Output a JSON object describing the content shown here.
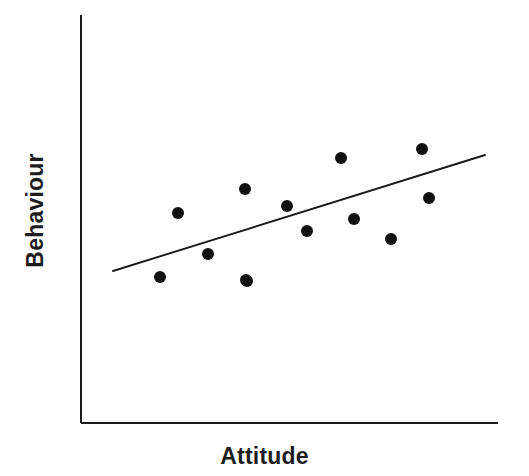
{
  "chart_data": {
    "type": "scatter",
    "title": "",
    "subtitle": "",
    "xlabel": "Attitude",
    "ylabel": "Behaviour",
    "grid": false,
    "legend": null,
    "axis_color": "#1a1a1a",
    "point_color": "#111111",
    "line_color": "#1a1a1a",
    "point_radius": 6,
    "xlim": [
      0,
      100
    ],
    "ylim": [
      0,
      100
    ],
    "axes": {
      "x_axis_pixel_y": 423,
      "y_axis_pixel_x": 81,
      "y_axis_top_pixel": 15,
      "x_axis_right_pixel": 498
    },
    "points": [
      {
        "px": 160,
        "py": 277,
        "x": 19.0,
        "y": 35.8
      },
      {
        "px": 178,
        "py": 213,
        "x": 23.3,
        "y": 51.5
      },
      {
        "px": 208,
        "py": 254,
        "x": 30.5,
        "y": 41.4
      },
      {
        "px": 245,
        "py": 189,
        "x": 39.3,
        "y": 57.4
      },
      {
        "px": 247,
        "py": 281,
        "x": 39.8,
        "y": 34.8
      },
      {
        "px": 287,
        "py": 206,
        "x": 49.4,
        "y": 53.2
      },
      {
        "px": 307,
        "py": 231,
        "x": 54.2,
        "y": 47.1
      },
      {
        "px": 341,
        "py": 158,
        "x": 62.4,
        "y": 65.0
      },
      {
        "px": 354,
        "py": 219,
        "x": 65.5,
        "y": 50.0
      },
      {
        "px": 391,
        "py": 239,
        "x": 74.3,
        "y": 45.1
      },
      {
        "px": 422,
        "py": 149,
        "x": 81.8,
        "y": 67.2
      },
      {
        "px": 429,
        "py": 198,
        "x": 83.5,
        "y": 55.2
      },
      {
        "px": 246,
        "py": 280,
        "x": 39.5,
        "y": 35.0
      }
    ],
    "trend_line": {
      "label": "regression line",
      "x1_px": 113,
      "y1_px": 271,
      "x2_px": 485,
      "y2_px": 155,
      "slope_note": "positive"
    },
    "relationship": "weak to moderate positive correlation"
  }
}
